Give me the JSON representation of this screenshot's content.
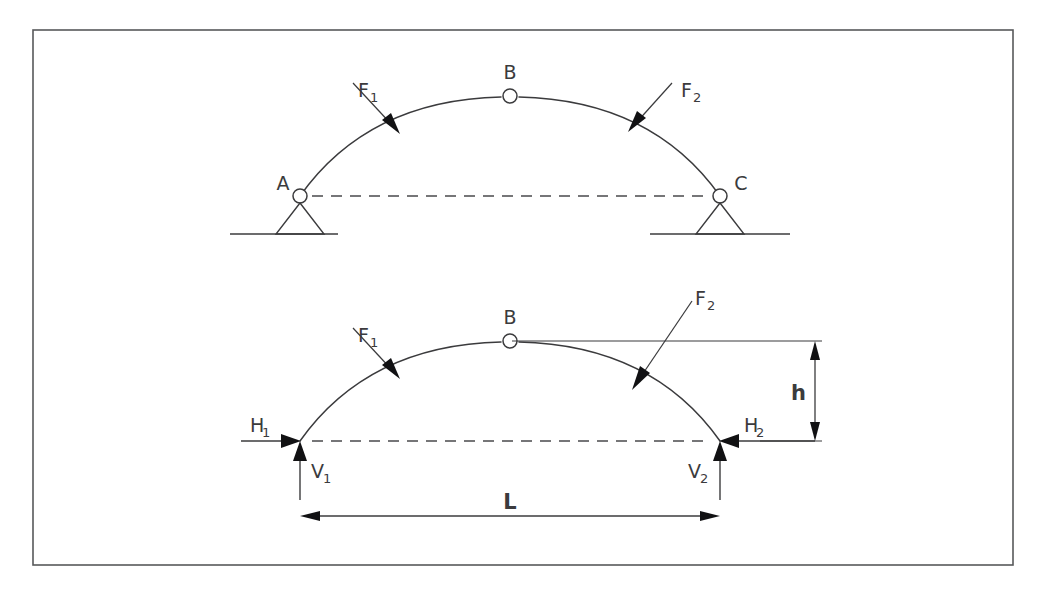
{
  "figure": {
    "border_color": "#58595b",
    "line_color": "#3b3b3d",
    "background": "#ffffff"
  },
  "top_diagram": {
    "name": "three-hinged-arch-supports",
    "nodes": [
      {
        "id": "A",
        "label": "A",
        "x": 300,
        "y": 196,
        "type": "pin-support"
      },
      {
        "id": "B",
        "label": "B",
        "x": 510,
        "y": 96,
        "type": "crown-hinge"
      },
      {
        "id": "C",
        "label": "C",
        "x": 720,
        "y": 196,
        "type": "pin-support"
      }
    ],
    "loads": [
      {
        "id": "F1",
        "label": "F",
        "sub": "1"
      },
      {
        "id": "F2",
        "label": "F",
        "sub": "2"
      }
    ]
  },
  "bottom_diagram": {
    "name": "three-hinged-arch-reactions",
    "nodes": [
      {
        "id": "B",
        "label": "B",
        "x": 510,
        "y": 341,
        "type": "crown-hinge"
      }
    ],
    "loads": [
      {
        "id": "F1",
        "label": "F",
        "sub": "1"
      },
      {
        "id": "F2",
        "label": "F",
        "sub": "2"
      }
    ],
    "reactions": [
      {
        "id": "H1",
        "label": "H",
        "sub": "1",
        "direction": "right"
      },
      {
        "id": "V1",
        "label": "V",
        "sub": "1",
        "direction": "up"
      },
      {
        "id": "H2",
        "label": "H",
        "sub": "2",
        "direction": "left"
      },
      {
        "id": "V2",
        "label": "V",
        "sub": "2",
        "direction": "up"
      }
    ],
    "dimensions": [
      {
        "id": "h",
        "label": "h",
        "orientation": "vertical"
      },
      {
        "id": "L",
        "label": "L",
        "orientation": "horizontal"
      }
    ]
  }
}
